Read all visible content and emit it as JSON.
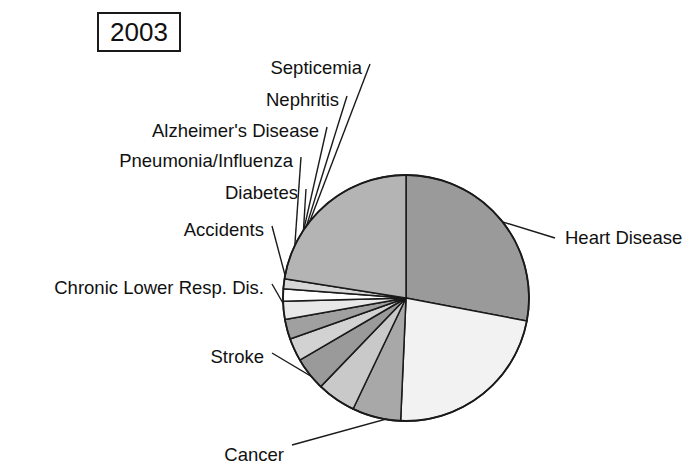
{
  "year_badge": {
    "label": "2003"
  },
  "chart_data": {
    "type": "pie",
    "title": "2003",
    "center": {
      "x": 406,
      "y": 298
    },
    "radius": 123,
    "start_angle_deg": 0,
    "direction": "clockwise",
    "legend": "none",
    "grid": false,
    "categories": [
      "Heart Disease",
      "Cancer",
      "Stroke",
      "Chronic Lower Resp. Dis.",
      "Accidents",
      "Diabetes",
      "Pneumonia/Influenza",
      "Alzheimer's Disease",
      "Nephritis",
      "Septicemia",
      "All Other Causes"
    ],
    "values": [
      28.0,
      22.7,
      6.4,
      5.1,
      4.4,
      3.0,
      2.6,
      2.4,
      1.6,
      1.3,
      22.5
    ],
    "slices": [
      {
        "label": "Heart Disease",
        "value": 28.0,
        "color": "#9a9a9a",
        "angle_deg": 100.8,
        "label_side": "right",
        "label_x": 565,
        "label_y": 238
      },
      {
        "label": "Cancer",
        "value": 22.7,
        "color": "#f2f2f2",
        "angle_deg": 81.7,
        "label_side": "bottom",
        "label_x": 284,
        "label_y": 455
      },
      {
        "label": "Stroke",
        "value": 6.4,
        "color": "#a8a8a8",
        "angle_deg": 23.0,
        "label_side": "left",
        "label_x": 264,
        "label_y": 357
      },
      {
        "label": "Chronic Lower Resp. Dis.",
        "value": 5.1,
        "color": "#c9c9c9",
        "angle_deg": 18.4,
        "label_side": "left",
        "label_x": 264,
        "label_y": 288
      },
      {
        "label": "Accidents",
        "value": 4.4,
        "color": "#9a9a9a",
        "angle_deg": 15.8,
        "label_side": "left",
        "label_x": 264,
        "label_y": 230
      },
      {
        "label": "Diabetes",
        "value": 3.0,
        "color": "#d2d2d2",
        "angle_deg": 10.8,
        "label_side": "left",
        "label_x": 298,
        "label_y": 193
      },
      {
        "label": "Pneumonia/Influenza",
        "value": 2.6,
        "color": "#a0a0a0",
        "angle_deg": 9.4,
        "label_side": "left",
        "label_x": 293,
        "label_y": 161
      },
      {
        "label": "Alzheimer's Disease",
        "value": 2.4,
        "color": "#e8e8e8",
        "angle_deg": 8.6,
        "label_side": "left",
        "label_x": 319,
        "label_y": 131
      },
      {
        "label": "Nephritis",
        "value": 1.6,
        "color": "#ffffff",
        "angle_deg": 5.8,
        "label_side": "left",
        "label_x": 339,
        "label_y": 100
      },
      {
        "label": "Septicemia",
        "value": 1.3,
        "color": "#d8d8d8",
        "angle_deg": 4.7,
        "label_side": "left",
        "label_x": 362,
        "label_y": 68
      }
    ],
    "colors": {
      "outline": "#1a1a1a",
      "background": "#ffffff",
      "heart_disease": "#9a9a9a",
      "cancer": "#f2f2f2",
      "stroke_slice": "#a8a8a8",
      "clrd": "#c9c9c9",
      "accidents": "#9a9a9a",
      "diabetes": "#d2d2d2",
      "pneumonia": "#a0a0a0",
      "alzheimers": "#e8e8e8",
      "nephritis": "#ffffff",
      "septicemia": "#d8d8d8"
    }
  }
}
